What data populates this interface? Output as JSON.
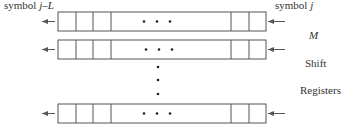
{
  "labels": {
    "left_prefix": "symbol ",
    "left_var": "j–L",
    "right_prefix": "symbol ",
    "right_var": "j",
    "m": "M",
    "shift": "Shift",
    "registers": "Registers"
  },
  "diagram": {
    "register_rows_drawn": 3,
    "ellipsis": "• • •",
    "arrows": {
      "input": "right-to-left into register",
      "output": "right-to-left out of register"
    },
    "line_color": "#555555"
  }
}
